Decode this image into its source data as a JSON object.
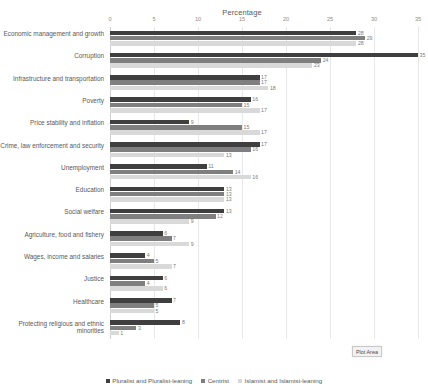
{
  "chart_data": {
    "type": "bar",
    "orientation": "horizontal",
    "title": "Percentage",
    "xlabel": "Percentage",
    "ylabel": "",
    "xlim": [
      0,
      35
    ],
    "xticks": [
      0,
      5,
      10,
      15,
      20,
      25,
      30,
      35
    ],
    "grid": true,
    "legend_position": "bottom",
    "categories": [
      "Economic management and growth",
      "Corruption",
      "Infrastructure and transportation",
      "Poverty",
      "Price stability and inflation",
      "Crime, law enforcement and security",
      "Unemployment",
      "Education",
      "Social welfare",
      "Agriculture, food and fishery",
      "Wages, income and salaries",
      "Justice",
      "Healthcare",
      "Protecting religious and ethnic minorities"
    ],
    "series": [
      {
        "name": "Pluralist and Pluralist-leaning",
        "color": "#3f3f3f",
        "values": [
          28,
          35,
          17,
          16,
          9,
          17,
          11,
          13,
          13,
          6,
          4,
          6,
          7,
          8
        ]
      },
      {
        "name": "Centrist",
        "color": "#7f7f7f",
        "values": [
          29,
          24,
          17,
          15,
          15,
          16,
          14,
          13,
          12,
          7,
          5,
          4,
          5,
          3
        ]
      },
      {
        "name": "Islamist and Islamist-leaning",
        "color": "#d9d9d9",
        "values": [
          28,
          23,
          18,
          17,
          17,
          13,
          16,
          13,
          9,
          9,
          7,
          6,
          5,
          1
        ]
      }
    ]
  },
  "tooltip": {
    "label": "Plot Area"
  }
}
